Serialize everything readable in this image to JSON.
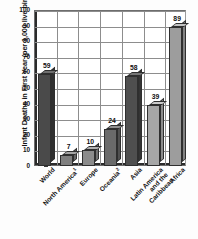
{
  "chart_data": {
    "type": "bar",
    "title": "",
    "xlabel": "",
    "ylabel": "Infant Deaths in First Year (per 1,000 live births)",
    "ylim": [
      0,
      100
    ],
    "ytick_step": 10,
    "yticks": [
      100,
      90,
      80,
      70,
      60,
      50,
      40,
      30,
      20,
      10,
      0
    ],
    "grid": true,
    "legend": "none",
    "categories": [
      "World",
      "North America",
      "Europe",
      "Oceania",
      "Asia",
      "Latin America and the Caribbean",
      "Africa"
    ],
    "category_footnotes": [
      "",
      "1",
      "",
      "2",
      "",
      "",
      ""
    ],
    "values": [
      59,
      7,
      10,
      24,
      58,
      39,
      89
    ],
    "value_labels": [
      "59",
      "7",
      "10",
      "24",
      "58",
      "39",
      "89"
    ],
    "bar_colors": [
      "#4a4a4a",
      "#7f7f7f",
      "#8b8b8b",
      "#6a6a6a",
      "#4f4f4f",
      "#a6a6a6",
      "#9d9d9d"
    ]
  },
  "style": {
    "plot_background": "#ffffff",
    "grid_color": "#8d8d8d",
    "axis_color": "#2b2b2b",
    "text_color": "#141414"
  }
}
